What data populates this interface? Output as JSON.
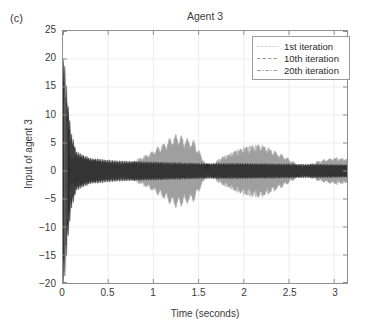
{
  "panel_label": "(c)",
  "chart_data": {
    "type": "line",
    "title": "Agent 3",
    "xlabel": "Time (seconds)",
    "ylabel": "Input of agent 3",
    "xlim": [
      0,
      3.1416
    ],
    "ylim": [
      -20,
      25
    ],
    "xticks": [
      0,
      0.5,
      1,
      1.5,
      2,
      2.5,
      3
    ],
    "xtick_labels": [
      "0",
      "0.5",
      "1",
      "1.5",
      "2",
      "2.5",
      "3"
    ],
    "yticks": [
      -20,
      -15,
      -10,
      -5,
      0,
      5,
      10,
      15,
      20,
      25
    ],
    "ytick_labels": [
      "-20",
      "-15",
      "-10",
      "-5",
      "0",
      "5",
      "10",
      "15",
      "20",
      "25"
    ],
    "grid": true,
    "legend_position": "upper right",
    "series": [
      {
        "name": "1st iteration",
        "label": "1st iteration",
        "linestyle": "dotted",
        "color": "#b4b4b4",
        "description": "Large initial transient spike near t=0 reaching about +18 to -16, decaying quickly to a low-amplitude oscillation.",
        "envelope_x": [
          0.0,
          0.02,
          0.05,
          0.09,
          0.15,
          0.3,
          0.6,
          1.0,
          1.5,
          2.0,
          2.5,
          3.1416
        ],
        "envelope_y": [
          18.0,
          16.0,
          11.0,
          6.0,
          3.0,
          2.0,
          1.6,
          1.4,
          1.2,
          1.2,
          1.1,
          1.0
        ]
      },
      {
        "name": "10th iteration",
        "label": "10th iteration",
        "linestyle": "dashed",
        "color": "#9a9a9a",
        "description": "Moderate amplitude oscillation with broad lobes; peaks near t=1.25 and t=2.2.",
        "envelope_x": [
          0.0,
          0.05,
          0.12,
          0.25,
          0.45,
          0.7,
          0.95,
          1.25,
          1.45,
          1.6,
          1.75,
          2.0,
          2.2,
          2.45,
          2.65,
          2.85,
          3.0,
          3.1416
        ],
        "envelope_y": [
          3.0,
          2.6,
          2.2,
          2.0,
          1.3,
          0.9,
          2.6,
          5.4,
          4.4,
          0.5,
          2.0,
          3.6,
          3.9,
          2.2,
          0.6,
          1.6,
          2.0,
          1.8
        ]
      },
      {
        "name": "20th iteration",
        "label": "20th iteration",
        "linestyle": "dashdot",
        "color": "#a3a3a3",
        "description": "Converged oscillation overlapping the 10th iteration envelope.",
        "envelope_x": [
          0.0,
          0.05,
          0.12,
          0.25,
          0.45,
          0.7,
          0.95,
          1.25,
          1.45,
          1.6,
          1.75,
          2.0,
          2.2,
          2.45,
          2.65,
          2.85,
          3.0,
          3.1416
        ],
        "envelope_y": [
          3.0,
          2.6,
          2.2,
          2.0,
          1.3,
          0.9,
          2.6,
          5.4,
          4.4,
          0.5,
          2.0,
          3.6,
          3.9,
          2.2,
          0.6,
          1.6,
          2.0,
          1.8
        ]
      }
    ],
    "annotations": [
      {
        "name": "pinch-marker",
        "x": 1.6,
        "y": 0.9,
        "note": "dark cluster at envelope pinch point"
      }
    ],
    "colors": {
      "axis": "#8e8e8e",
      "grid": "#ededed",
      "text": "#3a3a3a",
      "transient": "#262626",
      "envelope": "#9d9d9d",
      "legend_border": "#9a9a9a",
      "background": "#ffffff"
    }
  }
}
